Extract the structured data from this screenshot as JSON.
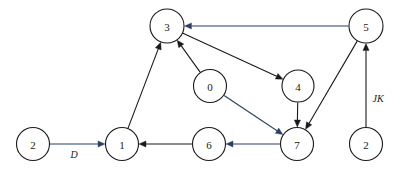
{
  "diagram": {
    "type": "directed-graph",
    "background_color": "#ffffff",
    "canvas": {
      "width": 402,
      "height": 172
    },
    "node_radius": 16.5,
    "colors": {
      "node_stroke": "#1a1a1a",
      "node_fill": "#ffffff",
      "edge_dark": "#1a1a1a",
      "edge_blue": "#2b3f66",
      "label_text": "#1a1a1a"
    },
    "nodes": [
      {
        "id": "n-2-left",
        "label": "2",
        "x": 33,
        "y": 144,
        "r": 16.5
      },
      {
        "id": "n-1",
        "label": "1",
        "x": 122,
        "y": 144,
        "r": 16.5
      },
      {
        "id": "n-3",
        "label": "3",
        "x": 167,
        "y": 26,
        "r": 17.0
      },
      {
        "id": "n-0",
        "label": "0",
        "x": 210,
        "y": 86,
        "r": 16.5
      },
      {
        "id": "n-6",
        "label": "6",
        "x": 209,
        "y": 144,
        "r": 16.5
      },
      {
        "id": "n-4",
        "label": "4",
        "x": 298,
        "y": 86,
        "r": 16.0
      },
      {
        "id": "n-7",
        "label": "7",
        "x": 297,
        "y": 144,
        "r": 16.5
      },
      {
        "id": "n-5",
        "label": "5",
        "x": 366,
        "y": 26,
        "r": 17.0
      },
      {
        "id": "n-2-right",
        "label": "2",
        "x": 366,
        "y": 144,
        "r": 16.5
      }
    ],
    "edges": [
      {
        "id": "e-2-1",
        "from": "n-2-left",
        "to": "n-1",
        "color": "#2b3f66",
        "label": "D",
        "label_x": 74,
        "label_y": 158
      },
      {
        "id": "e-1-3",
        "from": "n-1",
        "to": "n-3",
        "color": "#1a1a1a",
        "label": "",
        "label_x": 0,
        "label_y": 0
      },
      {
        "id": "e-0-3",
        "from": "n-0",
        "to": "n-3",
        "color": "#1a1a1a",
        "label": "",
        "label_x": 0,
        "label_y": 0
      },
      {
        "id": "e-3-4",
        "from": "n-3",
        "to": "n-4",
        "color": "#1a1a1a",
        "label": "",
        "label_x": 0,
        "label_y": 0
      },
      {
        "id": "e-5-3",
        "from": "n-5",
        "to": "n-3",
        "color": "#2b3f66",
        "label": "",
        "label_x": 0,
        "label_y": 0
      },
      {
        "id": "e-0-7",
        "from": "n-0",
        "to": "n-7",
        "color": "#2b3f66",
        "label": "",
        "label_x": 0,
        "label_y": 0
      },
      {
        "id": "e-4-7",
        "from": "n-4",
        "to": "n-7",
        "color": "#1a1a1a",
        "label": "",
        "label_x": 0,
        "label_y": 0
      },
      {
        "id": "e-5-7",
        "from": "n-5",
        "to": "n-7",
        "color": "#1a1a1a",
        "label": "",
        "label_x": 0,
        "label_y": 0
      },
      {
        "id": "e-7-6",
        "from": "n-7",
        "to": "n-6",
        "color": "#2b3f66",
        "label": "",
        "label_x": 0,
        "label_y": 0
      },
      {
        "id": "e-6-1",
        "from": "n-6",
        "to": "n-1",
        "color": "#1a1a1a",
        "label": "",
        "label_x": 0,
        "label_y": 0
      },
      {
        "id": "e-2-5",
        "from": "n-2-right",
        "to": "n-5",
        "color": "#1a1a1a",
        "label": "JK",
        "label_x": 378,
        "label_y": 102
      }
    ]
  }
}
